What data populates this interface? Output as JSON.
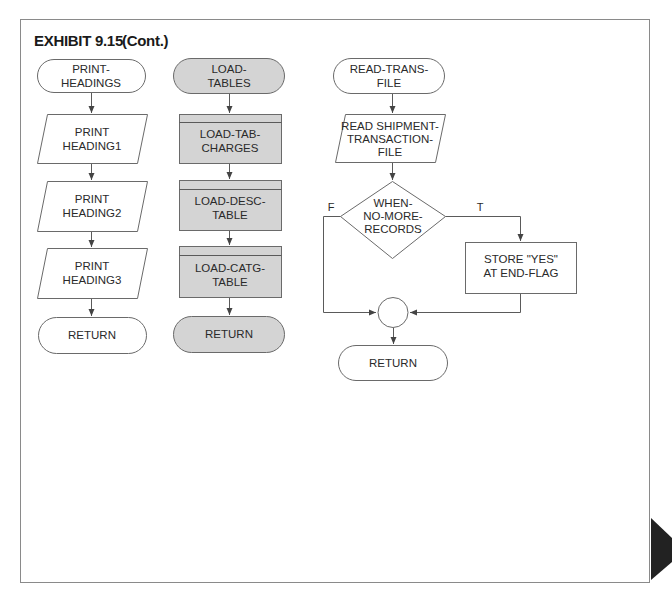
{
  "title": {
    "exhibit": "EXHIBIT 9.15",
    "suffix": "(Cont.)"
  },
  "colors": {
    "gray_fill": "#d4d4d4",
    "stroke": "#6a6a6a",
    "page_tab": "#222222"
  },
  "columns": [
    {
      "name": "print-headings",
      "nodes": [
        {
          "type": "terminator",
          "lines": [
            "PRINT-",
            "HEADINGS"
          ]
        },
        {
          "type": "io",
          "lines": [
            "PRINT",
            "HEADING1"
          ]
        },
        {
          "type": "io",
          "lines": [
            "PRINT",
            "HEADING2"
          ]
        },
        {
          "type": "io",
          "lines": [
            "PRINT",
            "HEADING3"
          ]
        },
        {
          "type": "terminator",
          "lines": [
            "RETURN"
          ]
        }
      ]
    },
    {
      "name": "load-tables",
      "shaded": true,
      "nodes": [
        {
          "type": "terminator",
          "lines": [
            "LOAD-",
            "TABLES"
          ]
        },
        {
          "type": "predefined-process",
          "lines": [
            "LOAD-TAB-",
            "CHARGES"
          ]
        },
        {
          "type": "predefined-process",
          "lines": [
            "LOAD-DESC-",
            "TABLE"
          ]
        },
        {
          "type": "predefined-process",
          "lines": [
            "LOAD-CATG-",
            "TABLE"
          ]
        },
        {
          "type": "terminator",
          "lines": [
            "RETURN"
          ]
        }
      ]
    },
    {
      "name": "read-trans-file",
      "nodes": [
        {
          "type": "terminator",
          "lines": [
            "READ-TRANS-",
            "FILE"
          ]
        },
        {
          "type": "io",
          "lines": [
            "READ SHIPMENT-",
            "TRANSACTION-",
            "FILE"
          ]
        },
        {
          "type": "decision",
          "lines": [
            "WHEN-",
            "NO-MORE-",
            "RECORDS"
          ],
          "false_label": "F",
          "true_label": "T"
        },
        {
          "type": "process",
          "lines": [
            "STORE \"YES\"",
            "AT END-FLAG"
          ]
        },
        {
          "type": "connector",
          "lines": []
        },
        {
          "type": "terminator",
          "lines": [
            "RETURN"
          ]
        }
      ]
    }
  ]
}
